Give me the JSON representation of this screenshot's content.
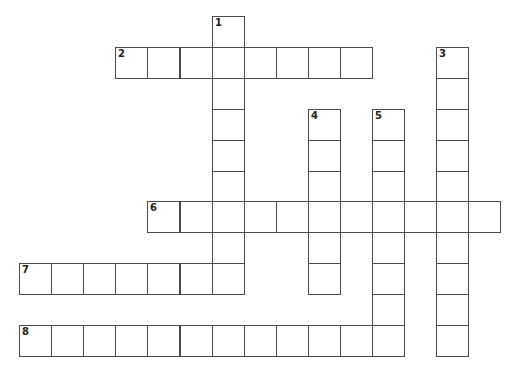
{
  "puzzle": {
    "type": "crossword",
    "grid": {
      "origin_x": 19,
      "origin_y": 16,
      "cell_w": 32.1,
      "cell_h": 30.9,
      "line_color": "#4a4a4a",
      "fill_color": "#ffffff"
    },
    "entries": [
      {
        "number": "1",
        "direction": "down",
        "row": 0,
        "col": 6,
        "length": 9
      },
      {
        "number": "2",
        "direction": "across",
        "row": 1,
        "col": 3,
        "length": 8
      },
      {
        "number": "3",
        "direction": "down",
        "row": 1,
        "col": 13,
        "length": 10
      },
      {
        "number": "4",
        "direction": "down",
        "row": 3,
        "col": 9,
        "length": 6
      },
      {
        "number": "5",
        "direction": "down",
        "row": 3,
        "col": 11,
        "length": 8
      },
      {
        "number": "6",
        "direction": "across",
        "row": 6,
        "col": 4,
        "length": 11
      },
      {
        "number": "7",
        "direction": "across",
        "row": 8,
        "col": 0,
        "length": 7
      },
      {
        "number": "8",
        "direction": "across",
        "row": 10,
        "col": 0,
        "length": 12
      }
    ]
  }
}
